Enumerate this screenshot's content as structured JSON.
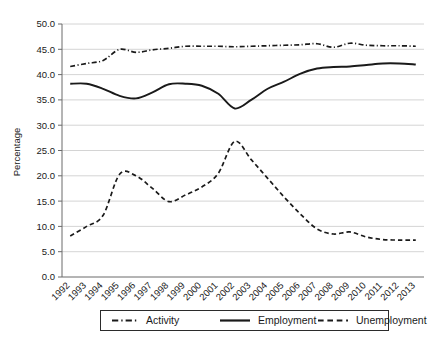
{
  "chart_data": {
    "type": "line",
    "title": "",
    "xlabel": "",
    "ylabel": "Percentage",
    "ylim": [
      0,
      50
    ],
    "ytick_step": 5,
    "grid": true,
    "legend_position": "bottom",
    "categories": [
      "1992",
      "1993",
      "1994",
      "1995",
      "1996",
      "1997",
      "1998",
      "1999",
      "2000",
      "2001",
      "2002",
      "2003",
      "2004",
      "2005",
      "2006",
      "2007",
      "2008",
      "2009",
      "2010",
      "2011",
      "2012",
      "2013"
    ],
    "ytick_labels": [
      "0.0",
      "5.0",
      "10.0",
      "15.0",
      "20.0",
      "25.0",
      "30.0",
      "35.0",
      "40.0",
      "45.0",
      "50.0"
    ],
    "ytick_values": [
      0,
      5,
      10,
      15,
      20,
      25,
      30,
      35,
      40,
      45,
      50
    ],
    "series": [
      {
        "name": "Activity",
        "style": "dash-dot",
        "color": "#1a1a1a",
        "values": [
          41.6,
          42.2,
          42.8,
          45.0,
          44.4,
          44.9,
          45.2,
          45.6,
          45.6,
          45.6,
          45.5,
          45.6,
          45.7,
          45.8,
          45.9,
          46.1,
          45.4,
          46.2,
          45.8,
          45.7,
          45.7,
          45.6
        ]
      },
      {
        "name": "Employment",
        "style": "solid",
        "color": "#1a1a1a",
        "values": [
          38.2,
          38.2,
          37.2,
          35.8,
          35.3,
          36.5,
          38.1,
          38.2,
          37.8,
          36.2,
          33.3,
          35.0,
          37.2,
          38.6,
          40.2,
          41.2,
          41.5,
          41.6,
          41.9,
          42.2,
          42.2,
          42.0
        ]
      },
      {
        "name": "Unemployment",
        "style": "dashed",
        "color": "#1a1a1a",
        "values": [
          8.1,
          10.0,
          12.2,
          20.3,
          20.0,
          17.5,
          14.9,
          16.2,
          17.8,
          20.5,
          26.8,
          23.2,
          19.5,
          15.8,
          12.4,
          9.5,
          8.5,
          8.9,
          7.9,
          7.4,
          7.3,
          7.3
        ]
      }
    ],
    "legend_entries": [
      {
        "label": "Activity",
        "style": "dash-dot"
      },
      {
        "label": "Employment",
        "style": "solid"
      },
      {
        "label": "Unemployment",
        "style": "dashed"
      }
    ]
  }
}
